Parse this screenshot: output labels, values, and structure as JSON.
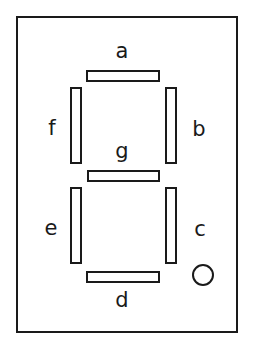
{
  "diagram": {
    "colors": {
      "ink": "#1a1a1a",
      "background": "#ffffff",
      "segment_fill": "#ffffff"
    },
    "package": {
      "name": "display-package-outline",
      "shape": "rectangle"
    },
    "segments": [
      {
        "id": "a",
        "label": "a",
        "orientation": "horizontal",
        "position": "top"
      },
      {
        "id": "b",
        "label": "b",
        "orientation": "vertical",
        "position": "upper-right"
      },
      {
        "id": "c",
        "label": "c",
        "orientation": "vertical",
        "position": "lower-right"
      },
      {
        "id": "d",
        "label": "d",
        "orientation": "horizontal",
        "position": "bottom"
      },
      {
        "id": "e",
        "label": "e",
        "orientation": "vertical",
        "position": "lower-left"
      },
      {
        "id": "f",
        "label": "f",
        "orientation": "vertical",
        "position": "upper-left"
      },
      {
        "id": "g",
        "label": "g",
        "orientation": "horizontal",
        "position": "middle"
      }
    ],
    "decimal_point": {
      "name": "decimal-point",
      "shape": "circle",
      "label": ""
    }
  }
}
